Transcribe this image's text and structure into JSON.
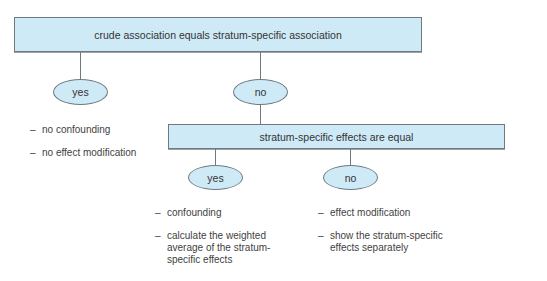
{
  "diagram": {
    "root": {
      "label": "crude association equals stratum-specific association",
      "yes": {
        "label": "yes",
        "outcomes": [
          "no confounding",
          "no effect modification"
        ]
      },
      "no": {
        "label": "no",
        "question": {
          "label": "stratum-specific effects are equal",
          "yes": {
            "label": "yes",
            "outcomes": [
              "confounding",
              "calculate the weighted average of the stratum-specific effects"
            ]
          },
          "no": {
            "label": "no",
            "outcomes": [
              "effect modification",
              "show the stratum-specific effects separately"
            ]
          }
        }
      }
    },
    "colors": {
      "node_fill": "#cfeaf7",
      "node_border": "#6f7a80",
      "text": "#333333"
    }
  }
}
